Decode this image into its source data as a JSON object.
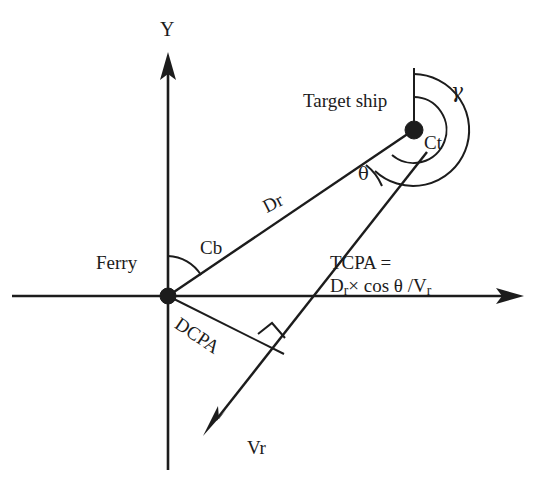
{
  "figure": {
    "kind": "geometry-diagram",
    "background_color": "#ffffff",
    "ink_color": "#1c1c1c"
  },
  "axes": {
    "y_label": "Y",
    "x_label": "",
    "origin_label": "Ferry"
  },
  "labels": {
    "ferry": "Ferry",
    "target_ship": "Target ship",
    "bearing_cb": "Cb",
    "course_ct": "Ct",
    "gamma": "γ",
    "theta": "θ",
    "range_dr": "Dr",
    "dcpa": "DCPA",
    "relative_velocity_vr": "Vr"
  },
  "formula": {
    "line1": "TCPA =",
    "line2_prefix": "D",
    "line2_sub1": "r",
    "line2_mid": "× cos θ /V",
    "line2_sub2": "r",
    "full_text": "TCPA = Dr× cos θ /Vr"
  },
  "geometry": {
    "origin": {
      "x": 168,
      "y": 296,
      "dot_radius": 8
    },
    "target_ship_node": {
      "x": 414,
      "y": 130,
      "dot_radius": 9
    },
    "y_axis": {
      "x": 168,
      "top_y": 58,
      "bottom_y": 470
    },
    "x_axis": {
      "y": 296,
      "left_x": 12,
      "right_x": 520
    },
    "dr_line": {
      "from": [
        168,
        296
      ],
      "to": [
        414,
        130
      ]
    },
    "vr_line": {
      "from": [
        425,
        148
      ],
      "to": [
        205,
        428
      ]
    },
    "dcpa_line": {
      "from": [
        168,
        296
      ],
      "to": [
        285,
        355
      ]
    },
    "target_vertical_ref": {
      "x": 414,
      "top_y": 68,
      "bottom_y": 130
    },
    "right_angle_marker": {
      "x": 272,
      "y": 341,
      "size": 17
    },
    "cb_arc_radius": 40,
    "ct_arc_radius": 33,
    "gamma_arc_radius": 56,
    "theta_arc_radius": 52
  }
}
